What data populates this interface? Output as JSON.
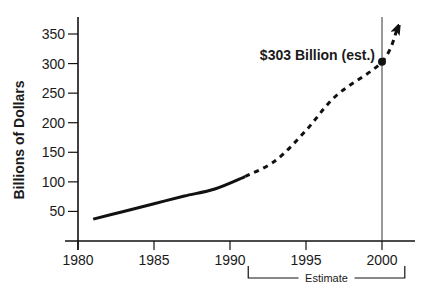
{
  "chart_data": {
    "type": "line",
    "title": "",
    "xlabel": "",
    "ylabel": "Billions of Dollars",
    "xlim": [
      1980,
      2002
    ],
    "ylim": [
      0,
      370
    ],
    "x_ticks": [
      1980,
      1985,
      1990,
      1995,
      2000
    ],
    "y_ticks": [
      50,
      100,
      150,
      200,
      250,
      300,
      350
    ],
    "grid": false,
    "series": [
      {
        "name": "Actual",
        "style": "solid",
        "x": [
          1981,
          1983,
          1985,
          1987,
          1989,
          1991
        ],
        "values": [
          37,
          50,
          63,
          76,
          88,
          109
        ]
      },
      {
        "name": "Estimate",
        "style": "dashed",
        "x": [
          1991,
          1993,
          1995,
          1997,
          2000,
          2001
        ],
        "values": [
          109,
          136,
          187,
          246,
          303,
          358
        ]
      }
    ],
    "annotations": [
      {
        "text": "$303 Billion (est.)",
        "x": 2000,
        "y": 303,
        "marker": "dot"
      },
      {
        "text": "Estimate",
        "type": "bracket",
        "x_range": [
          1991.2,
          2001.5
        ]
      }
    ],
    "reference_lines": [
      {
        "orientation": "vertical",
        "x": 2000
      }
    ]
  }
}
